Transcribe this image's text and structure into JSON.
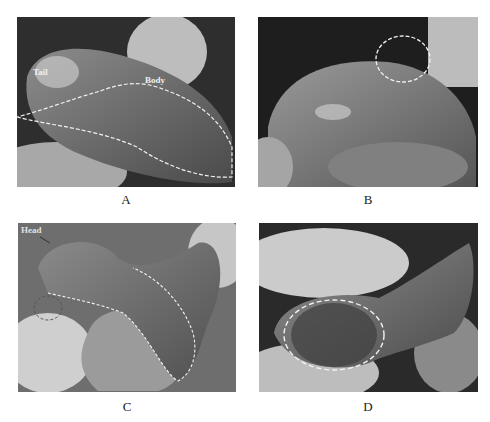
{
  "figure": {
    "panels": [
      {
        "id": "A",
        "caption": "A",
        "labels": [
          "Tail",
          "Body"
        ]
      },
      {
        "id": "B",
        "caption": "B",
        "labels": []
      },
      {
        "id": "C",
        "caption": "C",
        "labels": [
          "Head"
        ]
      },
      {
        "id": "D",
        "caption": "D",
        "labels": []
      }
    ]
  },
  "colors": {
    "outline": "#f2f2f2",
    "tissue_dark": "#3c3c3c",
    "tissue_mid": "#7a7a7a",
    "tissue_light": "#b8b8b8",
    "glove": "#cfcfcf"
  }
}
